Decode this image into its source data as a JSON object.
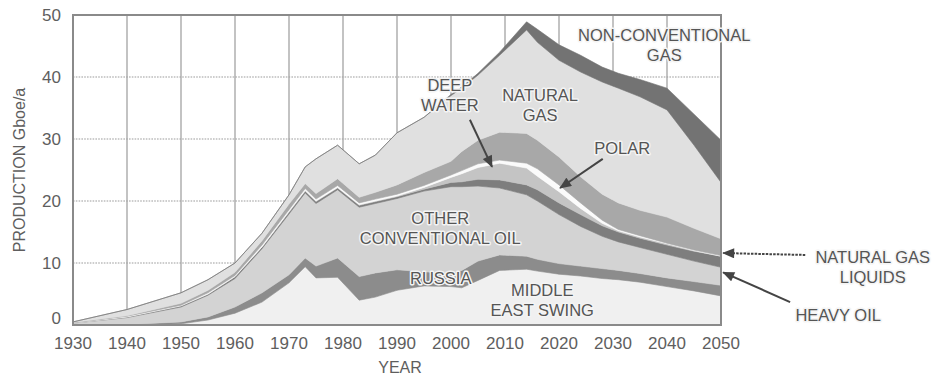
{
  "chart_data": {
    "type": "area",
    "stacked": true,
    "title": "",
    "xlabel": "YEAR",
    "ylabel": "PRODUCTION Gboe/a",
    "xlim": [
      1930,
      2050
    ],
    "ylim": [
      0,
      50
    ],
    "xticks": [
      1930,
      1940,
      1950,
      1960,
      1970,
      1980,
      1990,
      2000,
      2010,
      2020,
      2030,
      2040,
      2050
    ],
    "yticks": [
      0,
      10,
      20,
      30,
      40,
      50
    ],
    "grid": {
      "horizontal": "dotted",
      "vertical": "solid"
    },
    "legend": "none (inline labels with arrows)",
    "x": [
      1930,
      1940,
      1950,
      1955,
      1960,
      1965,
      1970,
      1973,
      1975,
      1979,
      1983,
      1986,
      1990,
      1995,
      2000,
      2002,
      2005,
      2009,
      2014,
      2016,
      2020,
      2024,
      2028,
      2031,
      2035,
      2040,
      2045,
      2050
    ],
    "series": [
      {
        "name": "Middle East swing",
        "color": "#f0f0f0",
        "values": [
          0,
          0,
          0.2,
          0.8,
          1.9,
          3.7,
          6.8,
          9.4,
          7.6,
          7.7,
          4.0,
          4.5,
          5.6,
          6.3,
          6.2,
          6.0,
          7.2,
          8.8,
          9.0,
          8.7,
          8.2,
          7.9,
          7.5,
          7.3,
          6.9,
          6.2,
          5.5,
          4.7
        ]
      },
      {
        "name": "Russia",
        "color": "#8c8c8c",
        "values": [
          0,
          0.1,
          0.3,
          0.5,
          1.0,
          1.5,
          1.3,
          1.4,
          1.9,
          3.1,
          3.8,
          3.9,
          3.3,
          2.3,
          2.1,
          2.8,
          3.1,
          2.5,
          2.1,
          1.9,
          1.7,
          1.6,
          1.6,
          1.5,
          1.4,
          1.4,
          1.5,
          1.7
        ]
      },
      {
        "name": "Other conventional oil",
        "color": "#d3d3d3",
        "values": [
          0.3,
          1.1,
          2.4,
          3.5,
          4.6,
          7.1,
          9.8,
          10.5,
          10.1,
          11.0,
          11.2,
          11.2,
          11.5,
          13.0,
          14.0,
          13.5,
          12.1,
          10.8,
          9.9,
          9.4,
          7.9,
          6.4,
          5.2,
          4.6,
          4.2,
          3.8,
          3.3,
          2.9
        ]
      },
      {
        "name": "Heavy oil",
        "color": "#7e7e7e",
        "values": [
          0,
          0.1,
          0.2,
          0.2,
          0.3,
          0.3,
          0.3,
          0.3,
          0.3,
          0.3,
          0.3,
          0.3,
          0.3,
          0.3,
          0.7,
          0.8,
          1.1,
          1.3,
          1.6,
          1.8,
          1.9,
          1.9,
          1.7,
          1.6,
          1.5,
          1.5,
          1.6,
          1.8
        ]
      },
      {
        "name": "Deep water",
        "color": "#c4c4c4",
        "values": [
          0,
          0,
          0,
          0,
          0,
          0,
          0.1,
          0.1,
          0.1,
          0.1,
          0.1,
          0.1,
          0.1,
          0.3,
          0.8,
          1.3,
          1.9,
          2.7,
          2.7,
          2.2,
          1.8,
          1.0,
          0.4,
          0.2,
          0.2,
          0.2,
          0.1,
          0
        ]
      },
      {
        "name": "Polar",
        "color": "#fbfbfb",
        "values": [
          0,
          0.1,
          0.1,
          0.2,
          0.2,
          0.3,
          0.3,
          0.3,
          0.3,
          0.3,
          0.3,
          0.3,
          0.3,
          0.3,
          0.4,
          0.5,
          0.6,
          0.5,
          0.8,
          1.2,
          1.1,
          0.9,
          0.5,
          0.2,
          0.2,
          0.1,
          0.1,
          0.1
        ]
      },
      {
        "name": "Natural gas liquids",
        "color": "#a8a8a8",
        "values": [
          0.1,
          0.1,
          0.3,
          0.4,
          0.5,
          0.7,
          0.9,
          0.8,
          0.9,
          1.1,
          0.9,
          1.1,
          1.5,
          2.1,
          2.2,
          3.1,
          3.8,
          4.5,
          4.8,
          4.6,
          4.5,
          4.2,
          4.2,
          4.3,
          4.1,
          4.2,
          3.5,
          2.7
        ]
      },
      {
        "name": "Natural gas",
        "color": "#e0e0e0",
        "values": [
          0.1,
          1.0,
          1.7,
          1.7,
          1.5,
          1.2,
          1.5,
          2.7,
          5.6,
          5.4,
          5.4,
          6.0,
          8.4,
          8.9,
          10.6,
          10.2,
          10.5,
          12.4,
          16.7,
          15.8,
          15.6,
          16.9,
          18.1,
          18.5,
          18.3,
          17.3,
          13.4,
          9.1
        ]
      },
      {
        "name": "Non-conventional gas",
        "color": "#737373",
        "values": [
          0,
          0,
          0,
          0,
          0,
          0,
          0,
          0,
          0,
          0,
          0,
          0,
          0,
          0,
          0.2,
          0.2,
          0.3,
          0.5,
          1.3,
          2.1,
          2.5,
          2.7,
          2.4,
          2.4,
          2.8,
          3.5,
          5.0,
          6.8
        ]
      }
    ],
    "annotations": [
      {
        "series": "Non-conventional gas",
        "lines": [
          "NON-CONVENTIONAL",
          "GAS"
        ],
        "x": 2039.5,
        "y": 46.8
      },
      {
        "series": "Natural gas",
        "lines": [
          "NATURAL",
          "GAS"
        ],
        "x": 2016.5,
        "y": 37.1
      },
      {
        "series": "Deep water",
        "lines": [
          "DEEP",
          "WATER"
        ],
        "x": 1999.8,
        "y": 38.7,
        "arrow": {
          "from": [
            2003.5,
            33.1
          ],
          "to": [
            2007.6,
            25.5
          ],
          "style": "solid"
        }
      },
      {
        "series": "Polar",
        "lines": [
          "POLAR"
        ],
        "x": 2031.7,
        "y": 28.5,
        "arrow": {
          "from": [
            2028.1,
            26.8
          ],
          "to": [
            2020.2,
            22.1
          ],
          "style": "solid"
        }
      },
      {
        "series": "Other conventional oil",
        "lines": [
          "OTHER",
          "CONVENTIONAL OIL"
        ],
        "x": 1998.0,
        "y": 17.3
      },
      {
        "series": "Russia",
        "lines": [
          "RUSSIA"
        ],
        "x": 1998.1,
        "y": 7.6
      },
      {
        "series": "Middle East swing",
        "lines": [
          "MIDDLE",
          "EAST SWING"
        ],
        "x": 2016.9,
        "y": 5.6
      },
      {
        "series": "Natural gas liquids",
        "lines": [
          "NATURAL GAS",
          "LIQUIDS"
        ],
        "x": 2078.1,
        "y": 11.0,
        "arrow": {
          "from": [
            2065.6,
            11.3
          ],
          "to": [
            2050.4,
            11.6
          ],
          "style": "dotted"
        }
      },
      {
        "series": "Heavy oil",
        "lines": [
          "HEAVY OIL"
        ],
        "x": 2071.7,
        "y": 1.6,
        "arrow": {
          "from": [
            2062.8,
            3.7
          ],
          "to": [
            2050.4,
            8.5
          ],
          "style": "solid"
        }
      }
    ]
  }
}
